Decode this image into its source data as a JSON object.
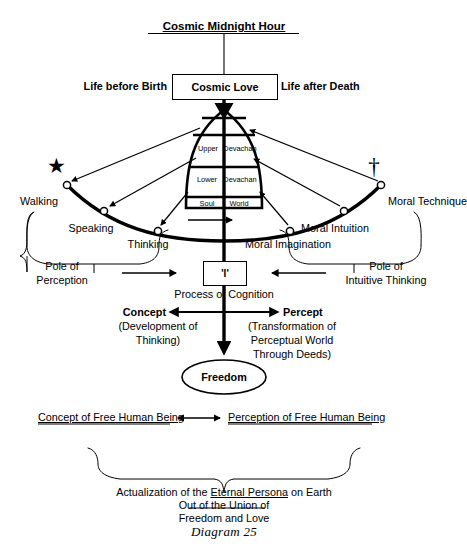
{
  "diagram": {
    "caption": "Diagram 25",
    "title": "Cosmic Midnight Hour",
    "colors": {
      "ink": "#000000",
      "paper": "#ffffff"
    },
    "top": {
      "heading": "Cosmic Midnight Hour",
      "left_label": "Life before Birth",
      "right_label": "Life after Death",
      "center_box": "Cosmic Love"
    },
    "dome": {
      "bands": [
        {
          "left": "Upper",
          "right": "Devachan"
        },
        {
          "left": "Lower",
          "right": "Devachan"
        },
        {
          "left": "Soul",
          "right": "World"
        }
      ]
    },
    "symbols": {
      "left": "star-symbol",
      "left_glyph": "★",
      "right": "cross-symbol",
      "right_glyph": "†"
    },
    "arc": {
      "left_nodes": [
        {
          "label": "Walking"
        },
        {
          "label": "Speaking"
        },
        {
          "label": "Thinking"
        }
      ],
      "right_nodes": [
        {
          "label": "Moral Imagination"
        },
        {
          "label": "Moral Intuition"
        },
        {
          "label": "Moral Technique"
        }
      ]
    },
    "poles": {
      "left": {
        "line1": "Pole of",
        "line2": "Perception"
      },
      "right": {
        "line1": "Pole of",
        "line2": "Intuitive Thinking"
      }
    },
    "center": {
      "ego_box": "'I'",
      "process": "Process of Cognition"
    },
    "duality": {
      "left": {
        "title": "Concept",
        "sub_line1": "(Development of",
        "sub_line2": "Thinking)"
      },
      "right": {
        "title": "Percept",
        "sub_line1": "(Transformation of",
        "sub_line2": "Perceptual World",
        "sub_line3": "Through Deeds)"
      }
    },
    "freedom": {
      "label": "Freedom"
    },
    "free_being": {
      "left": "Concept of Free Human Being",
      "right": "Perception of Free Human Being"
    },
    "conclusion": {
      "line1_pre": "Actualization of the ",
      "line1_em": "Eternal Persona",
      "line1_post": " on Earth",
      "line2": "Out of the Union of",
      "line3": "Freedom and Love"
    }
  }
}
